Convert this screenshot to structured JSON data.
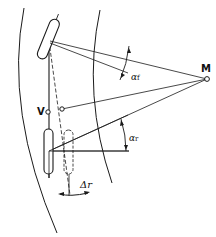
{
  "diagram": {
    "type": "bicycle steering geometry",
    "labels": {
      "center_point": "M",
      "rear_point": "V",
      "front_angle": "α",
      "front_angle_sub": "f",
      "rear_angle": "α",
      "rear_angle_sub": "r",
      "offset": "Δr"
    },
    "colors": {
      "line": "#1a1a1a",
      "background": "#ffffff"
    }
  }
}
